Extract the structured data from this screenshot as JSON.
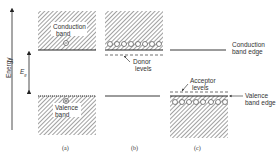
{
  "diagram": {
    "axis": {
      "label": "Energy",
      "gap_symbol": "E",
      "gap_subscript": "g"
    },
    "panels": [
      {
        "id": "a",
        "caption": "(a)",
        "conduction_label": "Conduction",
        "conduction_label2": "band",
        "valence_label": "Valence",
        "valence_label2": "band",
        "electron_symbol": "⊖",
        "hole_symbol": "⊕"
      },
      {
        "id": "b",
        "caption": "(b)",
        "donor_label": "Donor",
        "donor_label2": "levels"
      },
      {
        "id": "c",
        "caption": "(c)",
        "acceptor_label": "Acceptor",
        "acceptor_label2": "levels"
      }
    ],
    "edges": {
      "conduction": "Conduction",
      "conduction2": "band edge",
      "valence": "Valence",
      "valence2": "band edge"
    }
  }
}
